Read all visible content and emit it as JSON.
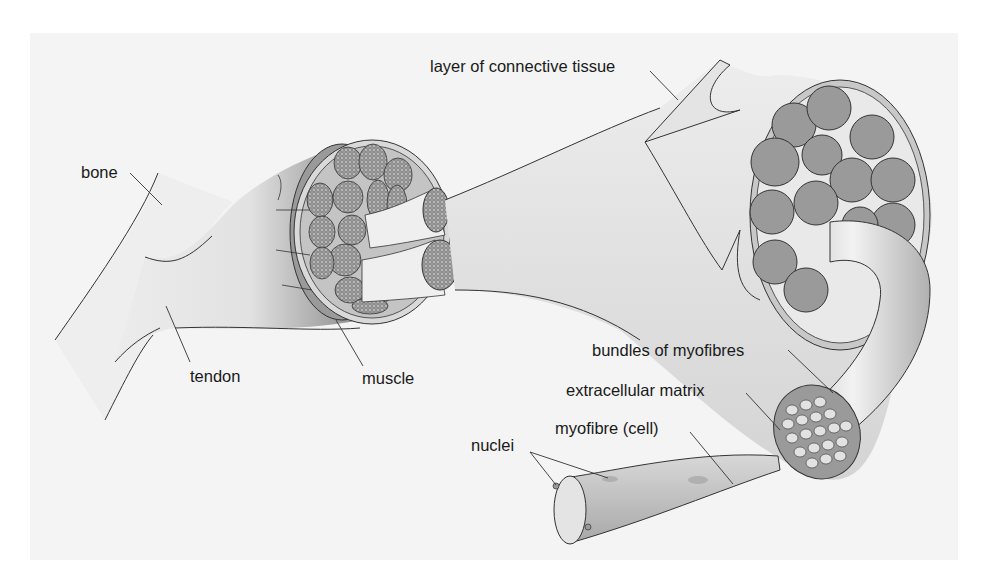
{
  "diagram": {
    "colors": {
      "background_panel": "#f4f4f4",
      "tissue_light": "#e6e6e6",
      "tissue_mid": "#bdbdbd",
      "tissue_dark": "#8f8f8f",
      "bundle_fill": "#9a9a9a",
      "outline": "#333333",
      "label_text": "#1a1a1a"
    },
    "labels": {
      "bone": "bone",
      "tendon": "tendon",
      "muscle": "muscle",
      "connective_tissue": "layer of connective tissue",
      "bundles": "bundles of myofibres",
      "matrix": "extracellular matrix",
      "myofibre": "myofibre (cell)",
      "nuclei": "nuclei"
    }
  }
}
